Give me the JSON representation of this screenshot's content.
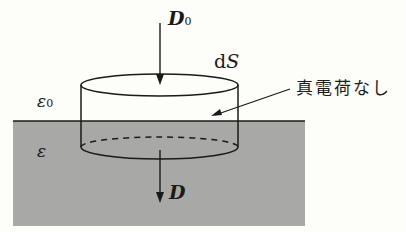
{
  "diagram": {
    "colors": {
      "background": "#fdfdf9",
      "dielectric_fill": "#a8a8a6",
      "stroke": "#1a1a1a"
    },
    "labels": {
      "D0": {
        "main": "D",
        "sub": "0"
      },
      "dS": {
        "d": "d",
        "S": "S"
      },
      "epsilon0": {
        "main": "ε",
        "sub": "0"
      },
      "epsilon": "ε",
      "D": "D",
      "no_true_charge": "真電荷なし"
    },
    "regions": [
      {
        "name": "vacuum",
        "permittivity": "ε0",
        "position": "above interface"
      },
      {
        "name": "dielectric",
        "permittivity": "ε",
        "position": "below interface"
      }
    ],
    "elements": [
      {
        "type": "pillbox-cylinder",
        "label": "dS",
        "spans": "interface"
      },
      {
        "type": "arrow",
        "direction": "down",
        "label": "D0",
        "location": "into top face"
      },
      {
        "type": "arrow",
        "direction": "down",
        "label": "D",
        "location": "out of bottom face"
      },
      {
        "type": "pointer-line",
        "label": "真電荷なし",
        "target": "pillbox at interface"
      }
    ]
  }
}
